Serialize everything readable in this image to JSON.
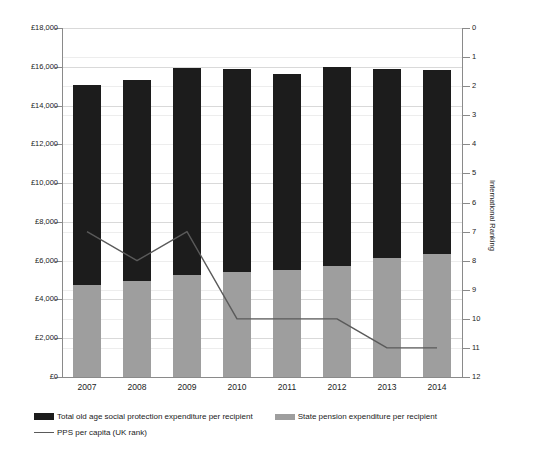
{
  "chart_data": {
    "type": "bar",
    "title": "",
    "subtitle": "",
    "xlabel": "",
    "ylabel": "",
    "categories": [
      "2007",
      "2008",
      "2009",
      "2010",
      "2011",
      "2012",
      "2013",
      "2014"
    ],
    "grid": true,
    "legend_position": "bottom",
    "left_axis": {
      "label": "",
      "ylim": [
        0,
        18000
      ],
      "tick_step": 2000,
      "tick_labels": [
        "£0",
        "£2,000",
        "£4,000",
        "£6,000",
        "£8,000",
        "£10,000",
        "£12,000",
        "£14,000",
        "£16,000",
        "£18,000"
      ],
      "tick_values": [
        0,
        2000,
        4000,
        6000,
        8000,
        10000,
        12000,
        14000,
        16000,
        18000
      ],
      "currency": "£"
    },
    "right_axis": {
      "label": "International Ranking",
      "ylim": [
        0,
        12
      ],
      "inverted": true,
      "tick_step": 1,
      "tick_labels": [
        "0",
        "1",
        "2",
        "3",
        "4",
        "5",
        "6",
        "7",
        "8",
        "9",
        "10",
        "11",
        "12"
      ],
      "tick_values": [
        0,
        1,
        2,
        3,
        4,
        5,
        6,
        7,
        8,
        9,
        10,
        11,
        12
      ]
    },
    "series": [
      {
        "name": "Total old age social protection expenditure per recipient",
        "type": "bar",
        "stack": "total",
        "color": "#1c1c1c",
        "axis": "left",
        "values": [
          15050,
          15300,
          15950,
          15900,
          15650,
          16000,
          15900,
          15850
        ]
      },
      {
        "name": "State pension expenditure per recipient",
        "type": "bar",
        "stack": "overlay",
        "color": "#9e9e9e",
        "axis": "left",
        "values": [
          4750,
          4950,
          5250,
          5400,
          5500,
          5700,
          6150,
          6350
        ]
      },
      {
        "name": "PPS per capita (UK rank)",
        "type": "line",
        "color": "#5a5a5a",
        "axis": "right",
        "values": [
          7,
          8,
          7,
          10,
          10,
          10,
          11,
          11
        ]
      }
    ]
  },
  "legend": {
    "items": [
      {
        "label": "Total old age social protection expenditure per recipient",
        "marker": "black-bar-swatch"
      },
      {
        "label": "State pension expenditure per recipient",
        "marker": "grey-bar-swatch"
      },
      {
        "label": "PPS per capita (UK rank)",
        "marker": "grey-line-swatch"
      }
    ]
  }
}
